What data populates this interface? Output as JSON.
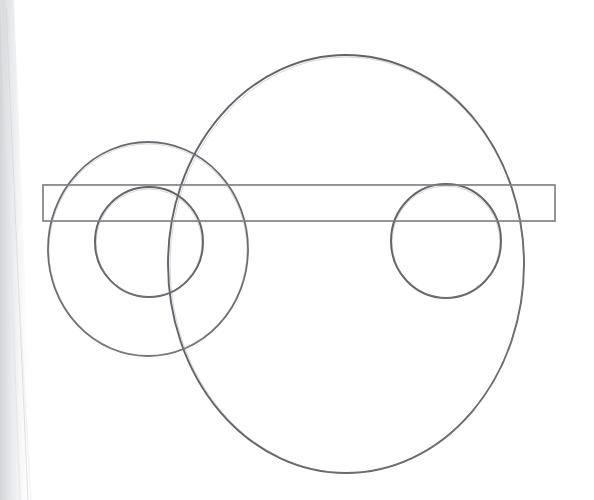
{
  "image": {
    "title": "Scanned pencil geometric construction",
    "description": "Hand-drawn overlapping circles and a long horizontal rectangle on white paper, photocopied/scanned with a dark page edge along the left margin.",
    "width": 594,
    "height": 500,
    "background_color": "#ffffff",
    "media": "graphite pencil / ink line drawing on white paper",
    "capture_artifacts": "diagonal scanned page edge shadow along the left side, slight paper grain"
  },
  "palette": {
    "paper": "#ffffff",
    "stroke_dark": "#5a5a5e",
    "stroke_medium": "#6f6f74",
    "stroke_light": "#9a9aa0",
    "stroke_faint": "#b9b9bf",
    "edge_shadow": "#d9dade"
  },
  "shapes": [
    {
      "name": "large-circle",
      "type": "ellipse",
      "cx": 346,
      "cy": 264,
      "rx": 178,
      "ry": 209,
      "stroke": "#62626a",
      "stroke_width": 1.9,
      "fill": "none",
      "note": "biggest outline, extends past top and bottom of frame interior"
    },
    {
      "name": "medium-circle",
      "type": "ellipse",
      "cx": 148,
      "cy": 249,
      "rx": 100,
      "ry": 107,
      "stroke": "#6a6a72",
      "stroke_width": 1.8,
      "fill": "none",
      "note": "left-hand ring, overlaps the large circle"
    },
    {
      "name": "left-small-circle",
      "type": "ellipse",
      "cx": 149,
      "cy": 242,
      "rx": 54,
      "ry": 55,
      "stroke": "#646468",
      "stroke_width": 2.0,
      "fill": "none",
      "note": "inner circle concentric-ish inside the medium ring"
    },
    {
      "name": "right-small-circle",
      "type": "ellipse",
      "cx": 446,
      "cy": 241,
      "rx": 55,
      "ry": 57,
      "stroke": "#646468",
      "stroke_width": 2.0,
      "fill": "none",
      "note": "matching small circle on the right inside the large circle"
    },
    {
      "name": "horizontal-rectangle",
      "type": "rect",
      "x": 43,
      "y": 185,
      "width": 512,
      "height": 36,
      "stroke": "#77777e",
      "stroke_width": 1.6,
      "fill": "none",
      "note": "long thin band crossing all circles horizontally"
    }
  ],
  "labels": {
    "none_present": "This drawing contains no text, numbers, axis ticks or legend."
  }
}
